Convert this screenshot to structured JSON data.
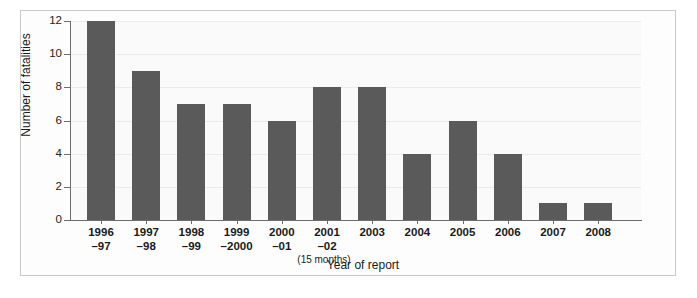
{
  "chart_data": {
    "type": "bar",
    "title": "",
    "xlabel": "Year of report",
    "ylabel": "Number of fatalities",
    "ylim": [
      0,
      12
    ],
    "yticks": [
      0,
      2,
      4,
      6,
      8,
      10,
      12
    ],
    "grid": true,
    "legend": null,
    "bar_color": "#5a5a5a",
    "categories": [
      "1996\n–97",
      "1997\n–98",
      "1998\n–99",
      "1999\n–2000",
      "2000\n–01",
      "2001\n–02",
      "2003",
      "2004",
      "2005",
      "2006",
      "2007",
      "2008"
    ],
    "category_lines": [
      {
        "line1": "1996",
        "line2": "–97",
        "note": ""
      },
      {
        "line1": "1997",
        "line2": "–98",
        "note": ""
      },
      {
        "line1": "1998",
        "line2": "–99",
        "note": ""
      },
      {
        "line1": "1999",
        "line2": "–2000",
        "note": ""
      },
      {
        "line1": "2000",
        "line2": "–01",
        "note": ""
      },
      {
        "line1": "2001",
        "line2": "–02",
        "note": "(15 months)"
      },
      {
        "line1": "2003",
        "line2": "",
        "note": ""
      },
      {
        "line1": "2004",
        "line2": "",
        "note": ""
      },
      {
        "line1": "2005",
        "line2": "",
        "note": ""
      },
      {
        "line1": "2006",
        "line2": "",
        "note": ""
      },
      {
        "line1": "2007",
        "line2": "",
        "note": ""
      },
      {
        "line1": "2008",
        "line2": "",
        "note": ""
      }
    ],
    "values": [
      12,
      9,
      7,
      7,
      6,
      8,
      8,
      4,
      6,
      4,
      1,
      1
    ],
    "annotations": [
      "(15 months)"
    ]
  },
  "caption": {
    "text": ""
  }
}
